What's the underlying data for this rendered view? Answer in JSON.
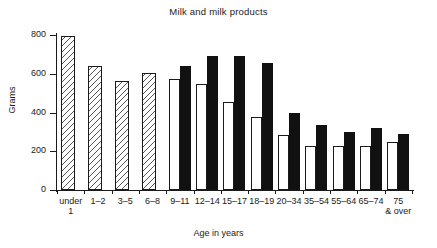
{
  "chart_data": {
    "type": "bar",
    "title": "Milk and milk products",
    "xlabel": "Age in years",
    "ylabel": "Grams",
    "ylim": [
      0,
      800
    ],
    "yticks": [
      0,
      200,
      400,
      600,
      800
    ],
    "ytick_labels": [
      "0",
      "200",
      "400",
      "600",
      "800"
    ],
    "grid": false,
    "legend": "none",
    "categories": [
      "under 1",
      "1–2",
      "3–5",
      "6–8",
      "9–11",
      "12–14",
      "15–17",
      "18–19",
      "20–34",
      "35–54",
      "55–64",
      "65–74",
      "75 & over"
    ],
    "category_lines": [
      [
        "under",
        "1"
      ],
      [
        "1–2",
        ""
      ],
      [
        "3–5",
        ""
      ],
      [
        "6–8",
        ""
      ],
      [
        "9–11",
        ""
      ],
      [
        "12–14",
        ""
      ],
      [
        "15–17",
        ""
      ],
      [
        "18–19",
        ""
      ],
      [
        "20–34",
        ""
      ],
      [
        "35–54",
        ""
      ],
      [
        "55–64",
        ""
      ],
      [
        "65–74",
        ""
      ],
      [
        "75",
        "& over"
      ]
    ],
    "series": [
      {
        "name": "Both sexes (hatched, under 9 years)",
        "style": "hatched",
        "values": [
          795,
          640,
          565,
          605,
          null,
          null,
          null,
          null,
          null,
          null,
          null,
          null,
          null
        ]
      },
      {
        "name": "Females (white)",
        "style": "white",
        "values": [
          null,
          null,
          null,
          null,
          575,
          548,
          455,
          375,
          285,
          225,
          228,
          228,
          250
        ]
      },
      {
        "name": "Males (black)",
        "style": "black",
        "values": [
          null,
          null,
          null,
          null,
          640,
          690,
          693,
          655,
          400,
          335,
          302,
          322,
          288
        ]
      }
    ]
  },
  "colors": {
    "axis": "#1a1a1a",
    "bar_black": "#111111",
    "bar_white": "#ffffff",
    "hatch_line": "#555555",
    "background": "#ffffff"
  }
}
